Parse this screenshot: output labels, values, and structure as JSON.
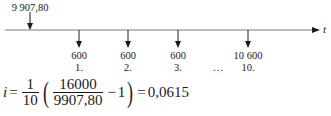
{
  "timeline": {
    "axis_label": "t",
    "present_value": {
      "label": "9 907,80",
      "x": 30
    },
    "payments": [
      {
        "amount": "600",
        "period": "1.",
        "x": 79
      },
      {
        "amount": "600",
        "period": "2.",
        "x": 128
      },
      {
        "amount": "600",
        "period": "3.",
        "x": 178
      },
      {
        "amount": "",
        "period": "…",
        "x": 218
      },
      {
        "amount": "10 600",
        "period": "10.",
        "x": 248
      }
    ],
    "colors": {
      "line": "#7a7a7a",
      "arrow": "#1a1a1a",
      "text": "#1a1a1a"
    }
  },
  "formula": {
    "variable": "i",
    "equals": "=",
    "outer_num": "1",
    "outer_den": "10",
    "inner_num": "16000",
    "inner_den": "9907,80",
    "minus": "−",
    "one": "1",
    "result": "0,0615",
    "open_paren": "(",
    "close_paren": ")"
  }
}
